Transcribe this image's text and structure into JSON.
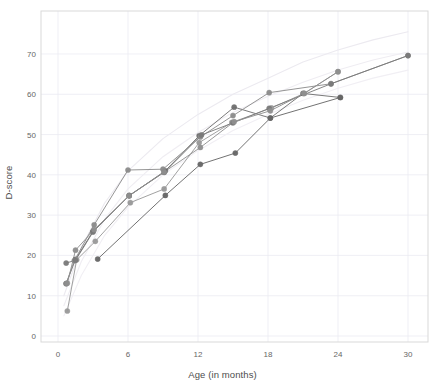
{
  "chart_data": {
    "type": "line",
    "title": "",
    "subtitle": "",
    "xlabel": "Age (in months)",
    "ylabel": "D-score",
    "xlim": [
      -1.5,
      31.5
    ],
    "ylim": [
      -2.5,
      78
    ],
    "xticks": [
      0,
      6,
      12,
      18,
      24,
      30
    ],
    "yticks": [
      0,
      10,
      20,
      30,
      40,
      50,
      60,
      70
    ],
    "xtick_labels": [
      "0",
      "6",
      "12",
      "18",
      "24",
      "30"
    ],
    "ytick_labels": [
      "0",
      "10",
      "20",
      "30",
      "40",
      "50",
      "60",
      "70"
    ],
    "grid": true,
    "grid_color": "#ebebf2",
    "panel_background": "#ffffff",
    "panel_border_color": "#d9d9d9",
    "legend": "none",
    "marker": "filled-circle",
    "marker_size": 2.6,
    "series": [
      {
        "name": "subject-1",
        "color": "#6e6e6e",
        "x": [
          0.7,
          1.5,
          3.0,
          6.1,
          9.2,
          12.1,
          15.1,
          18.2,
          21.0,
          24.2
        ],
        "y": [
          13.0,
          19.0,
          26.0,
          34.8,
          41.0,
          49.7,
          56.8,
          54.1,
          60.2,
          59.2
        ]
      },
      {
        "name": "subject-2",
        "color": "#8c8c8c",
        "x": [
          0.7,
          1.4,
          3.1,
          6.0,
          9.0,
          12.2,
          15.0,
          18.1,
          23.4,
          30.0
        ],
        "y": [
          13.0,
          18.7,
          27.6,
          41.2,
          41.4,
          49.4,
          54.7,
          60.4,
          62.6,
          69.6
        ]
      },
      {
        "name": "subject-3",
        "color": "#999999",
        "x": [
          0.8,
          1.6,
          3.2,
          6.2,
          9.1,
          12.1,
          14.9,
          18.3,
          21.1,
          24.0
        ],
        "y": [
          6.2,
          18.9,
          23.5,
          33.1,
          36.5,
          48.0,
          53.0,
          56.6,
          60.2,
          65.6
        ]
      },
      {
        "name": "subject-4",
        "color": "#7a7a7a",
        "x": [
          0.7,
          1.5,
          3.0,
          6.1,
          9.1,
          12.3,
          15.0,
          18.1,
          23.4,
          30.0
        ],
        "y": [
          18.1,
          18.8,
          25.8,
          34.9,
          40.6,
          49.9,
          52.9,
          56.5,
          62.6,
          69.6
        ]
      },
      {
        "name": "subject-5",
        "color": "#666666",
        "x": [
          3.4,
          9.2,
          12.2,
          15.2,
          18.2,
          24.2
        ],
        "y": [
          19.1,
          34.9,
          42.6,
          45.4,
          54.1,
          59.2
        ]
      },
      {
        "name": "subject-6",
        "color": "#8f8f8f",
        "x": [
          0.8,
          1.5,
          3.1,
          6.1,
          9.1,
          12.2,
          15.1,
          18.2,
          21.1,
          24.0
        ],
        "y": [
          13.1,
          21.3,
          26.4,
          34.8,
          40.7,
          46.8,
          53.2,
          55.9,
          60.2,
          65.6
        ]
      }
    ],
    "reference_curves": [
      {
        "name": "reference-upper",
        "color": "#eceaf0",
        "x": [
          0.5,
          2,
          4,
          6,
          9,
          12,
          15,
          18,
          21,
          24,
          27,
          30
        ],
        "y": [
          10.0,
          22.0,
          33.0,
          41.0,
          49.0,
          55.0,
          60.0,
          64.0,
          68.0,
          71.0,
          73.5,
          75.5
        ]
      },
      {
        "name": "reference-mid",
        "color": "#efedf2",
        "x": [
          0.5,
          2,
          4,
          6,
          9,
          12,
          15,
          18,
          21,
          24,
          27,
          30
        ],
        "y": [
          7.5,
          18.5,
          29.0,
          36.5,
          44.5,
          50.5,
          55.5,
          59.5,
          63.0,
          66.0,
          68.5,
          70.5
        ]
      },
      {
        "name": "reference-lower",
        "color": "#f1eff4",
        "x": [
          0.5,
          2,
          4,
          6,
          9,
          12,
          15,
          18,
          21,
          24,
          27,
          30
        ],
        "y": [
          5.0,
          15.0,
          25.0,
          32.0,
          40.0,
          46.0,
          51.0,
          55.0,
          58.5,
          61.5,
          64.0,
          66.0
        ]
      }
    ]
  },
  "plot_geometry": {
    "panel_left": 41,
    "panel_top": 11,
    "panel_right": 428,
    "panel_bottom": 342,
    "x_pixel_at_zero": 58,
    "x_pixels_per_month": 11.667,
    "y_pixel_at_zero": 336,
    "y_pixels_per_unit": 4.029
  }
}
